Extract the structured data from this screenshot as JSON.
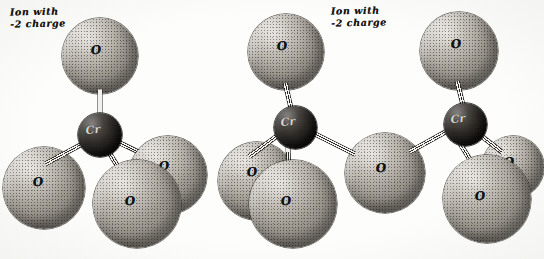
{
  "figure": {
    "background_color": "#fdfdfb",
    "oxygen_color": "#a9a49b",
    "chromium_color": "#211f1c",
    "bond_color": "#f2f0ec",
    "outline_color": "#2b2925"
  },
  "captions": [
    {
      "id": "left-caption",
      "line1": "Ion with",
      "line2": "-2 charge",
      "x": 10,
      "y": 6
    },
    {
      "id": "right-caption",
      "line1": "Ion with",
      "line2": "-2 charge",
      "x": 331,
      "y": 5
    }
  ],
  "models": [
    {
      "id": "chromate",
      "name": "chromate-ion-model",
      "charge": "-2",
      "atoms": [
        {
          "id": "L-O-top",
          "element": "O",
          "label": "O",
          "x": 62,
          "y": 18,
          "d": 76,
          "kind": "oxygen",
          "z": 2,
          "lx": 96,
          "ly": 50
        },
        {
          "id": "L-Cr",
          "element": "Cr",
          "label": "Cr",
          "x": 78,
          "y": 113,
          "d": 44,
          "kind": "chromium",
          "z": 6,
          "lx": 93,
          "ly": 130
        },
        {
          "id": "L-O-left",
          "element": "O",
          "label": "O",
          "x": 3,
          "y": 147,
          "d": 82,
          "kind": "oxygen",
          "z": 4,
          "lx": 38,
          "ly": 182
        },
        {
          "id": "L-O-right",
          "element": "O",
          "label": "O",
          "x": 129,
          "y": 136,
          "d": 78,
          "kind": "oxygen",
          "z": 5,
          "lx": 164,
          "ly": 166
        },
        {
          "id": "L-O-front",
          "element": "O",
          "label": "O",
          "x": 93,
          "y": 160,
          "d": 88,
          "kind": "oxygen",
          "z": 7,
          "lx": 130,
          "ly": 201
        }
      ],
      "bonds": [
        {
          "from": "L-Cr",
          "to": "L-O-top",
          "x1": 100,
          "y1": 118,
          "x2": 100,
          "y2": 92,
          "z": 3
        },
        {
          "from": "L-Cr",
          "to": "L-O-left",
          "x1": 85,
          "y1": 142,
          "x2": 48,
          "y2": 162,
          "z": 5
        },
        {
          "from": "L-Cr",
          "to": "L-O-right",
          "x1": 117,
          "y1": 141,
          "x2": 150,
          "y2": 157,
          "z": 5
        },
        {
          "from": "L-Cr",
          "to": "L-O-front",
          "x1": 106,
          "y1": 147,
          "x2": 124,
          "y2": 176,
          "z": 6
        }
      ]
    },
    {
      "id": "dichromate",
      "name": "dichromate-ion-model",
      "charge": "-2",
      "atoms": [
        {
          "id": "R-O-topL",
          "element": "O",
          "label": "O",
          "x": 248,
          "y": 14,
          "d": 76,
          "kind": "oxygen",
          "z": 2,
          "lx": 282,
          "ly": 46
        },
        {
          "id": "R-O-topR",
          "element": "O",
          "label": "O",
          "x": 420,
          "y": 12,
          "d": 78,
          "kind": "oxygen",
          "z": 2,
          "lx": 456,
          "ly": 44
        },
        {
          "id": "R-Cr-left",
          "element": "Cr",
          "label": "Cr",
          "x": 274,
          "y": 106,
          "d": 43,
          "kind": "chromium",
          "z": 6,
          "lx": 288,
          "ly": 122
        },
        {
          "id": "R-Cr-right",
          "element": "Cr",
          "label": "Cr",
          "x": 444,
          "y": 103,
          "d": 43,
          "kind": "chromium",
          "z": 6,
          "lx": 458,
          "ly": 119
        },
        {
          "id": "R-O-bridge",
          "element": "O",
          "label": "O",
          "x": 345,
          "y": 133,
          "d": 80,
          "kind": "oxygen",
          "z": 4,
          "lx": 381,
          "ly": 168
        },
        {
          "id": "R-O-farL",
          "element": "O",
          "label": "O",
          "x": 218,
          "y": 142,
          "d": 78,
          "kind": "oxygen",
          "z": 3,
          "lx": 252,
          "ly": 172
        },
        {
          "id": "R-O-frontL",
          "element": "O",
          "label": "O",
          "x": 249,
          "y": 160,
          "d": 88,
          "kind": "oxygen",
          "z": 7,
          "lx": 286,
          "ly": 201
        },
        {
          "id": "R-O-farR",
          "element": "O",
          "label": "O",
          "x": 482,
          "y": 136,
          "d": 62,
          "kind": "oxygen",
          "z": 3,
          "lx": 509,
          "ly": 162
        },
        {
          "id": "R-O-frontR",
          "element": "O",
          "label": "O",
          "x": 443,
          "y": 155,
          "d": 88,
          "kind": "oxygen",
          "z": 7,
          "lx": 480,
          "ly": 196
        }
      ],
      "bonds": [
        {
          "from": "R-Cr-left",
          "to": "R-O-topL",
          "x1": 292,
          "y1": 112,
          "x2": 286,
          "y2": 86,
          "z": 3
        },
        {
          "from": "R-Cr-right",
          "to": "R-O-topR",
          "x1": 464,
          "y1": 109,
          "x2": 458,
          "y2": 84,
          "z": 3
        },
        {
          "from": "R-Cr-left",
          "to": "R-O-bridge",
          "x1": 312,
          "y1": 132,
          "x2": 352,
          "y2": 152,
          "z": 5
        },
        {
          "from": "R-Cr-right",
          "to": "R-O-bridge",
          "x1": 448,
          "y1": 130,
          "x2": 412,
          "y2": 150,
          "z": 5
        },
        {
          "from": "R-Cr-left",
          "to": "R-O-farL",
          "x1": 279,
          "y1": 134,
          "x2": 252,
          "y2": 154,
          "z": 5
        },
        {
          "from": "R-Cr-left",
          "to": "R-O-frontL",
          "x1": 288,
          "y1": 145,
          "x2": 289,
          "y2": 176,
          "z": 6
        },
        {
          "from": "R-Cr-right",
          "to": "R-O-farR",
          "x1": 477,
          "y1": 132,
          "x2": 500,
          "y2": 150,
          "z": 5
        },
        {
          "from": "R-Cr-right",
          "to": "R-O-frontR",
          "x1": 460,
          "y1": 143,
          "x2": 478,
          "y2": 172,
          "z": 6
        }
      ]
    }
  ]
}
